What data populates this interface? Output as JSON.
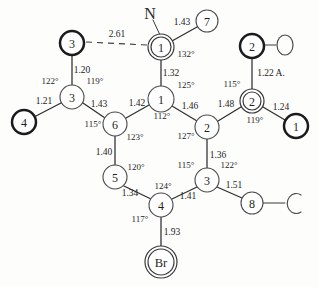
{
  "figure": {
    "kind": "molecular-structure-diagram",
    "units_note": "1.22 A.",
    "atoms": [
      {
        "id": "a-n1",
        "label": "1",
        "style": "double",
        "x": 161,
        "y": 47,
        "r": 13
      },
      {
        "id": "a-n7",
        "label": "7",
        "style": "thin",
        "x": 207,
        "y": 21,
        "r": 11
      },
      {
        "id": "a-o3t",
        "label": "3",
        "style": "bold",
        "x": 72,
        "y": 43,
        "r": 12
      },
      {
        "id": "a-c3l",
        "label": "3",
        "style": "thin",
        "x": 72,
        "y": 97,
        "r": 12
      },
      {
        "id": "a-o4",
        "label": "4",
        "style": "bold",
        "x": 24,
        "y": 122,
        "r": 12
      },
      {
        "id": "a-c6",
        "label": "6",
        "style": "thin",
        "x": 115,
        "y": 124,
        "r": 12
      },
      {
        "id": "a-c1",
        "label": "1",
        "style": "thin",
        "x": 161,
        "y": 99,
        "r": 13
      },
      {
        "id": "a-c2",
        "label": "2",
        "style": "thin",
        "x": 207,
        "y": 127,
        "r": 12
      },
      {
        "id": "a-c2r",
        "label": "2",
        "style": "double",
        "x": 252,
        "y": 101,
        "r": 12
      },
      {
        "id": "a-o2t",
        "label": "2",
        "style": "bold",
        "x": 252,
        "y": 46,
        "r": 12
      },
      {
        "id": "a-o1r",
        "label": "1",
        "style": "bold",
        "x": 296,
        "y": 126,
        "r": 12
      },
      {
        "id": "a-c3r",
        "label": "3",
        "style": "thin",
        "x": 207,
        "y": 180,
        "r": 12
      },
      {
        "id": "a-c8",
        "label": "8",
        "style": "thin",
        "x": 252,
        "y": 203,
        "r": 11
      },
      {
        "id": "a-c5",
        "label": "5",
        "style": "thin",
        "x": 115,
        "y": 177,
        "r": 12
      },
      {
        "id": "a-c4",
        "label": "4",
        "style": "thin",
        "x": 161,
        "y": 205,
        "r": 12
      },
      {
        "id": "a-br",
        "label": "Br",
        "style": "double",
        "x": 161,
        "y": 262,
        "r": 16
      }
    ],
    "element_labels": [
      {
        "id": "lbl-n",
        "text": "N",
        "x": 150,
        "y": 13
      },
      {
        "id": "lbl-o",
        "text": "O",
        "x": 285,
        "y": 45
      },
      {
        "id": "lbl-c",
        "text": "C",
        "x": 294,
        "y": 204
      }
    ],
    "bond_lengths": [
      {
        "id": "len-n1-n7",
        "value": "1.43",
        "x": 182,
        "y": 22
      },
      {
        "id": "len-hbond",
        "value": "2.61",
        "x": 117,
        "y": 34
      },
      {
        "id": "len-n1-c1",
        "value": "1.32",
        "x": 171,
        "y": 73
      },
      {
        "id": "len-o3t-c3l",
        "value": "1.20",
        "x": 82,
        "y": 70
      },
      {
        "id": "len-c3l-o4",
        "value": "1.21",
        "x": 44,
        "y": 101
      },
      {
        "id": "len-c3l-c6",
        "value": "1.43",
        "x": 99,
        "y": 104
      },
      {
        "id": "len-c6-c1",
        "value": "1.42",
        "x": 137,
        "y": 103
      },
      {
        "id": "len-c1-c2",
        "value": "1.46",
        "x": 190,
        "y": 106
      },
      {
        "id": "len-c2-c2r",
        "value": "1.48",
        "x": 226,
        "y": 104
      },
      {
        "id": "len-c2r-o2t",
        "value": "1.22 A.",
        "x": 271,
        "y": 73
      },
      {
        "id": "len-c2r-o1r",
        "value": "1.24",
        "x": 281,
        "y": 107
      },
      {
        "id": "len-c2-c3r",
        "value": "1.36",
        "x": 218,
        "y": 155
      },
      {
        "id": "len-c3r-c8",
        "value": "1.51",
        "x": 234,
        "y": 185
      },
      {
        "id": "len-c6-c5",
        "value": "1.40",
        "x": 104,
        "y": 152
      },
      {
        "id": "len-c5-c4",
        "value": "1.34",
        "x": 130,
        "y": 193
      },
      {
        "id": "len-c4-c3r",
        "value": "1.41",
        "x": 188,
        "y": 196
      },
      {
        "id": "len-c4-br",
        "value": "1.93",
        "x": 172,
        "y": 232
      }
    ],
    "bond_angles": [
      {
        "id": "ang-n1",
        "value": "132°",
        "x": 186,
        "y": 54
      },
      {
        "id": "ang-c3l-l",
        "value": "122°",
        "x": 50,
        "y": 81
      },
      {
        "id": "ang-c3l-r",
        "value": "119°",
        "x": 95,
        "y": 81
      },
      {
        "id": "ang-c6-l",
        "value": "115°",
        "x": 93,
        "y": 124
      },
      {
        "id": "ang-c6-r",
        "value": "123°",
        "x": 135,
        "y": 137
      },
      {
        "id": "ang-c1-r",
        "value": "125°",
        "x": 186,
        "y": 85
      },
      {
        "id": "ang-c1-b",
        "value": "112°",
        "x": 162,
        "y": 116
      },
      {
        "id": "ang-c2-l",
        "value": "127°",
        "x": 186,
        "y": 136
      },
      {
        "id": "ang-c2r-l",
        "value": "115°",
        "x": 232,
        "y": 84
      },
      {
        "id": "ang-c2r-b",
        "value": "119°",
        "x": 255,
        "y": 120
      },
      {
        "id": "ang-c3r-l",
        "value": "115°",
        "x": 186,
        "y": 165
      },
      {
        "id": "ang-c3r-r",
        "value": "122°",
        "x": 229,
        "y": 165
      },
      {
        "id": "ang-c5-r",
        "value": "120°",
        "x": 136,
        "y": 167
      },
      {
        "id": "ang-c4-t",
        "value": "124°",
        "x": 163,
        "y": 186
      },
      {
        "id": "ang-c4-b",
        "value": "117°",
        "x": 140,
        "y": 219
      }
    ]
  }
}
